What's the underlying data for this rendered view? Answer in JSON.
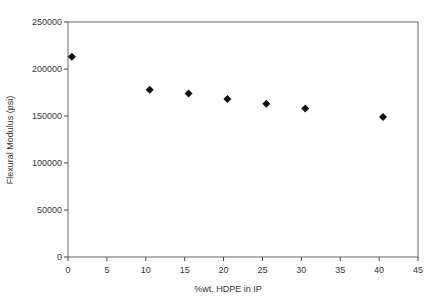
{
  "chart_data": {
    "type": "scatter",
    "title": "",
    "xlabel": "%wt. HDPE in IP",
    "ylabel": "Flexural Modulus (psi)",
    "xlim": [
      0,
      45
    ],
    "ylim": [
      0,
      250000
    ],
    "xticks": [
      0,
      5,
      10,
      15,
      20,
      25,
      30,
      35,
      40,
      45
    ],
    "yticks": [
      0,
      50000,
      100000,
      150000,
      200000,
      250000
    ],
    "grid": false,
    "legend": null,
    "marker": "diamond",
    "marker_color": "#111111",
    "x": [
      0.5,
      10.5,
      15.5,
      20.5,
      25.5,
      30.5,
      40.5
    ],
    "y": [
      213000,
      178000,
      174000,
      168000,
      163000,
      158000,
      149000
    ]
  },
  "axes": {
    "x_title": "%wt. HDPE in IP",
    "y_title": "Flexural Modulus (psi)"
  }
}
